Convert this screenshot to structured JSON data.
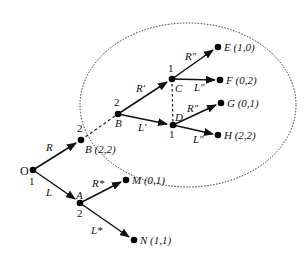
{
  "diagram": {
    "type": "game-tree",
    "ellipse": {
      "cx": 188,
      "cy": 105,
      "rx": 108,
      "ry": 82,
      "style": "dotted"
    },
    "nodes": {
      "O": {
        "label": "O",
        "player": "1",
        "x": 33,
        "y": 170
      },
      "B_out": {
        "label": "B",
        "payoff": "(2,2)",
        "player": "2",
        "x": 81,
        "y": 140
      },
      "A": {
        "label": "A",
        "player": "2",
        "x": 80,
        "y": 203
      },
      "M": {
        "label": "M",
        "payoff": "(0,1)",
        "x": 126,
        "y": 180
      },
      "N": {
        "label": "N",
        "payoff": "(1,1)",
        "x": 134,
        "y": 240
      },
      "B_in": {
        "label": "B",
        "player": "2",
        "x": 118,
        "y": 114
      },
      "C": {
        "label": "C",
        "player": "1",
        "x": 172,
        "y": 79
      },
      "D": {
        "label": "D",
        "player": "1",
        "x": 173,
        "y": 125
      },
      "E": {
        "label": "E",
        "payoff": "(1,0)",
        "x": 218,
        "y": 47
      },
      "F": {
        "label": "F",
        "payoff": "(0,2)",
        "x": 220,
        "y": 80
      },
      "G": {
        "label": "G",
        "payoff": "(0,1)",
        "x": 221,
        "y": 103
      },
      "H": {
        "label": "H",
        "payoff": "(2,2)",
        "x": 218,
        "y": 135
      }
    },
    "edges": {
      "O_B": "R",
      "O_A": "L",
      "A_M": "R*",
      "A_N": "L*",
      "B_C": "R′",
      "B_D": "L′",
      "C_E": "R″",
      "C_F": "L″",
      "D_G": "R″",
      "D_H": "L″"
    },
    "labels": {
      "O": "O",
      "O_player": "1",
      "B_out_text": "B (2,2)",
      "B_out_player": "2",
      "A": "A",
      "A_player": "2",
      "M_text": "M (0,1)",
      "N_text": "N (1,1)",
      "B_in": "B",
      "B_in_player": "2",
      "C": "C",
      "C_player": "1",
      "D": "D",
      "D_player": "1",
      "E_text": "E (1,0)",
      "F_text": "F (0,2)",
      "G_text": "G (0,1)",
      "H_text": "H (2,2)"
    }
  }
}
